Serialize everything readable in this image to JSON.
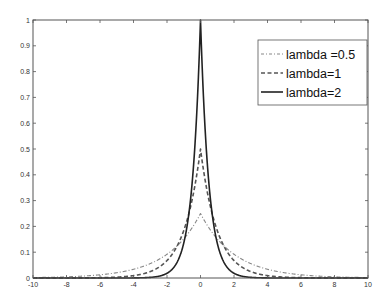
{
  "chart_data": {
    "type": "line",
    "title": "",
    "xlabel": "",
    "ylabel": "",
    "xlim": [
      -10,
      10
    ],
    "ylim": [
      0,
      1
    ],
    "grid": false,
    "legend_position": "upper right",
    "x_ticks": [
      -10,
      -8,
      -6,
      -4,
      -2,
      0,
      2,
      4,
      6,
      8,
      10
    ],
    "x_tick_labels": [
      "-10",
      "-8",
      "-6",
      "-4",
      "-2",
      "0",
      "2",
      "4",
      "6",
      "8",
      "10"
    ],
    "y_ticks": [
      0,
      0.1,
      0.2,
      0.3,
      0.4,
      0.5,
      0.6,
      0.7,
      0.8,
      0.9,
      1
    ],
    "y_tick_labels": [
      "0",
      "0.1",
      "0.2",
      "0.3",
      "0.4",
      "0.5",
      "0.6",
      "0.7",
      "0.8",
      "0.9",
      "1"
    ],
    "function": "f(x) = (lambda/2) * exp(-lambda*|x|)",
    "series": [
      {
        "name": "lambda =0.5",
        "lambda": 0.5,
        "style": "dashdot",
        "color": "#888888",
        "peak": 0.25,
        "x": [
          -10,
          -8,
          -6,
          -4,
          -2,
          -1,
          0,
          1,
          2,
          4,
          6,
          8,
          10
        ],
        "values": [
          0.0017,
          0.0046,
          0.0124,
          0.0338,
          0.092,
          0.152,
          0.25,
          0.152,
          0.092,
          0.0338,
          0.0124,
          0.0046,
          0.0017
        ]
      },
      {
        "name": "lambda=1",
        "lambda": 1,
        "style": "dashed",
        "color": "#555555",
        "peak": 0.5,
        "x": [
          -10,
          -8,
          -6,
          -4,
          -2,
          -1,
          0,
          1,
          2,
          4,
          6,
          8,
          10
        ],
        "values": [
          2e-05,
          0.00017,
          0.0012,
          0.0092,
          0.068,
          0.184,
          0.5,
          0.184,
          0.068,
          0.0092,
          0.0012,
          0.00017,
          2e-05
        ]
      },
      {
        "name": "lambda=2",
        "lambda": 2,
        "style": "solid",
        "color": "#222222",
        "peak": 1.0,
        "x": [
          -10,
          -8,
          -6,
          -4,
          -2,
          -1,
          0,
          1,
          2,
          4,
          6,
          8,
          10
        ],
        "values": [
          0.0,
          0.0,
          0.0,
          0.0003,
          0.018,
          0.135,
          1.0,
          0.135,
          0.018,
          0.0003,
          0.0,
          0.0,
          0.0
        ]
      }
    ]
  },
  "legend": {
    "items": [
      {
        "label": "lambda =0.5"
      },
      {
        "label": "lambda=1"
      },
      {
        "label": "lambda=2"
      }
    ]
  }
}
